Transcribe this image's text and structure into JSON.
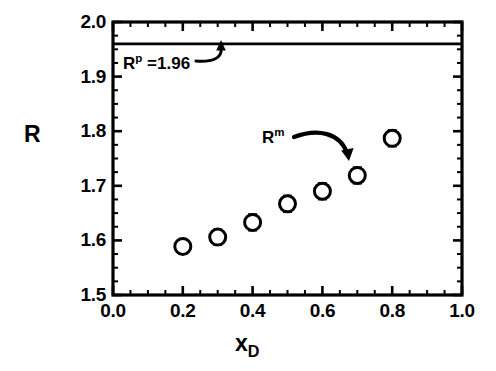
{
  "chart_data": {
    "type": "scatter",
    "title": "",
    "xlabel": "x_D",
    "ylabel": "R",
    "xlim": [
      0.0,
      1.0
    ],
    "ylim": [
      1.5,
      2.0
    ],
    "grid": false,
    "legend": "none",
    "x_ticks": [
      "0.0",
      "0.2",
      "0.4",
      "0.6",
      "0.8",
      "1.0"
    ],
    "x_tick_values": [
      0.0,
      0.2,
      0.4,
      0.6,
      0.8,
      1.0
    ],
    "x_minor_step": 0.05,
    "y_ticks": [
      "1.5",
      "1.6",
      "1.7",
      "1.8",
      "1.9",
      "2.0"
    ],
    "y_tick_values": [
      1.5,
      1.6,
      1.7,
      1.8,
      1.9,
      2.0
    ],
    "y_minor_step": 0.025,
    "series": [
      {
        "name": "R^m",
        "marker": "open-circle",
        "x": [
          0.2,
          0.3,
          0.4,
          0.5,
          0.6,
          0.7,
          0.8
        ],
        "values": [
          1.589,
          1.606,
          1.633,
          1.667,
          1.69,
          1.719,
          1.787
        ],
        "yerr": [
          0.013,
          0.013,
          0.014,
          0.014,
          0.014,
          0.014,
          0.014
        ]
      }
    ],
    "reference_lines": [
      {
        "name": "R^p",
        "orientation": "horizontal",
        "value": 1.96,
        "label": "R^p =1.96"
      }
    ],
    "annotations": [
      {
        "name": "rp-annotation",
        "text_main": "R",
        "text_sup": "p",
        "text_rest": " =1.96",
        "arrow": "curved-up-right",
        "points_to": "reference-line"
      },
      {
        "name": "rm-annotation",
        "text_main": "R",
        "text_sup": "m",
        "text_rest": "",
        "arrow": "curved-right-down",
        "points_to": "data-series"
      }
    ]
  },
  "axis": {
    "y_label": "R",
    "x_label_main": "x",
    "x_label_sub": "D"
  },
  "colors": {
    "foreground": "#000000",
    "background": "#ffffff",
    "marker_fill": "#ffffff",
    "marker_stroke": "#000000"
  }
}
